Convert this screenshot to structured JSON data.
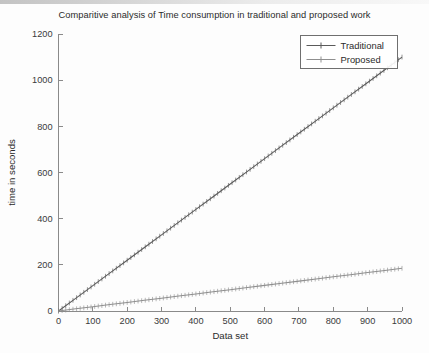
{
  "chart_data": {
    "type": "line",
    "title": "Comparitive analysis of Time consumption in traditional and proposed work",
    "xlabel": "Data set",
    "ylabel": "time in seconds",
    "xlim": [
      0,
      1000
    ],
    "ylim": [
      0,
      1200
    ],
    "xticks": [
      0,
      100,
      200,
      300,
      400,
      500,
      600,
      700,
      800,
      900,
      1000
    ],
    "yticks": [
      0,
      200,
      400,
      600,
      800,
      1000,
      1200
    ],
    "grid": false,
    "legend_position": "upper right",
    "x": [
      0,
      50,
      100,
      150,
      200,
      250,
      300,
      350,
      400,
      450,
      500,
      550,
      600,
      650,
      700,
      750,
      800,
      850,
      900,
      950,
      1000
    ],
    "series": [
      {
        "name": "Traditional",
        "color": "#5a5a5a",
        "marker": "plus",
        "values": [
          0,
          55,
          110,
          165,
          220,
          275,
          330,
          385,
          440,
          495,
          550,
          605,
          660,
          715,
          770,
          825,
          880,
          935,
          990,
          1045,
          1100
        ]
      },
      {
        "name": "Proposed",
        "color": "#8f8f8f",
        "marker": "plus",
        "values": [
          0,
          9.3,
          18.5,
          27.8,
          37,
          46.3,
          55.5,
          64.8,
          74,
          83.3,
          92.5,
          101.8,
          111,
          120.3,
          129.5,
          138.8,
          148,
          157.3,
          166.5,
          175.8,
          185
        ]
      }
    ]
  },
  "axes": {
    "xtick_labels": [
      "0",
      "100",
      "200",
      "300",
      "400",
      "500",
      "600",
      "700",
      "800",
      "900",
      "1000"
    ],
    "ytick_labels": [
      "0",
      "200",
      "400",
      "600",
      "800",
      "1000",
      "1200"
    ]
  },
  "legend": {
    "items": [
      {
        "label": "Traditional"
      },
      {
        "label": "Proposed"
      }
    ]
  },
  "colors": {
    "background": "#fdfdfd",
    "axis": "#8a8a8a",
    "text": "#2b2b2b",
    "traditional": "#5a5a5a",
    "proposed": "#8f8f8f"
  }
}
